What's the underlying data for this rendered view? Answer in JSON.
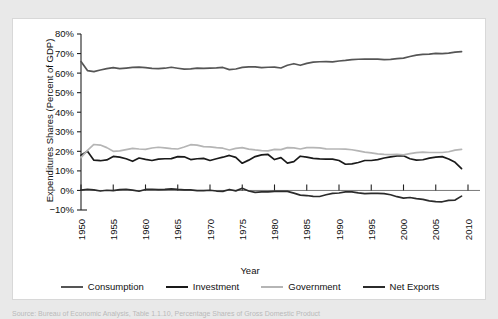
{
  "chart_data": {
    "type": "line",
    "title": "",
    "xlabel": "Year",
    "ylabel": "Expenditures Shares (Percent of GDP)",
    "xlim": [
      1950,
      2010
    ],
    "ylim": [
      -10,
      80
    ],
    "xticks": [
      "1950",
      "1955",
      "1960",
      "1965",
      "1970",
      "1975",
      "1980",
      "1985",
      "1990",
      "1995",
      "2000",
      "2005",
      "2010"
    ],
    "yticks": [
      "-10%",
      "0%",
      "10%",
      "20%",
      "30%",
      "40%",
      "50%",
      "60%",
      "70%",
      "80%"
    ],
    "grid": false,
    "legend_position": "bottom",
    "x": [
      1950,
      1951,
      1952,
      1953,
      1954,
      1955,
      1956,
      1957,
      1958,
      1959,
      1960,
      1961,
      1962,
      1963,
      1964,
      1965,
      1966,
      1967,
      1968,
      1969,
      1970,
      1971,
      1972,
      1973,
      1974,
      1975,
      1976,
      1977,
      1978,
      1979,
      1980,
      1981,
      1982,
      1983,
      1984,
      1985,
      1986,
      1987,
      1988,
      1989,
      1990,
      1991,
      1992,
      1993,
      1994,
      1995,
      1996,
      1997,
      1998,
      1999,
      2000,
      2001,
      2002,
      2003,
      2004,
      2005,
      2006,
      2007,
      2008,
      2009
    ],
    "series": [
      {
        "name": "Consumption",
        "color": "#555555",
        "values": [
          65.9,
          61.3,
          60.8,
          61.6,
          62.3,
          62.8,
          62.3,
          62.6,
          62.9,
          63.1,
          62.8,
          62.4,
          62.3,
          62.5,
          63.0,
          62.5,
          62.0,
          62.2,
          62.5,
          62.4,
          62.6,
          62.7,
          62.9,
          61.8,
          62.1,
          62.9,
          63.2,
          63.2,
          62.8,
          63.0,
          63.1,
          62.6,
          64.0,
          64.8,
          64.0,
          65.0,
          65.6,
          65.8,
          65.9,
          65.7,
          66.2,
          66.5,
          66.9,
          67.1,
          67.2,
          67.2,
          67.2,
          66.9,
          67.0,
          67.4,
          67.7,
          68.5,
          69.2,
          69.6,
          69.7,
          70.1,
          70.0,
          70.2,
          70.7,
          71.0
        ]
      },
      {
        "name": "Investment",
        "color": "#1a1a1a",
        "values": [
          18.0,
          20.0,
          15.5,
          15.2,
          15.6,
          17.4,
          17.0,
          16.2,
          14.9,
          16.6,
          15.9,
          15.3,
          16.0,
          16.2,
          16.3,
          17.3,
          17.2,
          15.8,
          16.2,
          16.4,
          15.3,
          16.2,
          17.0,
          17.9,
          16.9,
          13.9,
          15.5,
          17.3,
          18.2,
          18.4,
          15.8,
          16.8,
          14.0,
          14.7,
          17.5,
          17.0,
          16.4,
          16.1,
          16.0,
          16.0,
          15.3,
          13.4,
          13.6,
          14.3,
          15.3,
          15.3,
          15.8,
          16.6,
          17.2,
          17.7,
          17.7,
          16.2,
          15.5,
          15.7,
          16.5,
          17.0,
          17.3,
          16.1,
          14.4,
          11.2
        ]
      },
      {
        "name": "Government",
        "color": "#b5b5b5",
        "values": [
          16.8,
          20.5,
          23.5,
          23.2,
          21.9,
          20.0,
          20.2,
          20.9,
          21.5,
          21.2,
          21.0,
          21.7,
          22.1,
          21.8,
          21.4,
          21.2,
          22.2,
          23.4,
          23.2,
          22.4,
          22.3,
          21.9,
          21.6,
          20.7,
          21.5,
          21.9,
          21.1,
          20.7,
          20.4,
          20.2,
          21.0,
          20.9,
          21.9,
          21.8,
          21.2,
          21.9,
          21.9,
          21.8,
          21.3,
          21.2,
          21.2,
          21.1,
          20.8,
          20.2,
          19.6,
          19.2,
          18.7,
          18.4,
          18.3,
          18.4,
          18.2,
          18.8,
          19.3,
          19.6,
          19.4,
          19.4,
          19.4,
          19.8,
          20.6,
          21.0
        ]
      },
      {
        "name": "Net Exports",
        "color": "#2b2b2b",
        "values": [
          0.2,
          0.6,
          0.3,
          -0.3,
          0.1,
          -0.1,
          0.4,
          0.6,
          0.2,
          -0.4,
          0.5,
          0.6,
          0.4,
          0.5,
          0.8,
          0.5,
          0.3,
          0.3,
          -0.1,
          -0.1,
          0.1,
          -0.3,
          -0.5,
          0.5,
          -0.2,
          1.1,
          -0.3,
          -1.0,
          -0.7,
          -0.7,
          -0.5,
          -0.4,
          -0.5,
          -1.4,
          -2.4,
          -2.6,
          -3.0,
          -3.1,
          -2.2,
          -1.5,
          -1.3,
          -0.7,
          -0.7,
          -1.2,
          -1.6,
          -1.5,
          -1.5,
          -1.6,
          -2.2,
          -3.2,
          -3.9,
          -3.6,
          -4.2,
          -4.6,
          -5.3,
          -5.7,
          -5.8,
          -5.1,
          -4.9,
          -2.9
        ]
      }
    ]
  },
  "legend": {
    "items": [
      {
        "label": "Consumption"
      },
      {
        "label": "Investment"
      },
      {
        "label": "Government"
      },
      {
        "label": "Net Exports"
      }
    ]
  },
  "caption": {
    "text": "Source:  Bureau of Economic Analysis, Table 1.1.10, Percentage Shares of Gross Domestic Product"
  }
}
